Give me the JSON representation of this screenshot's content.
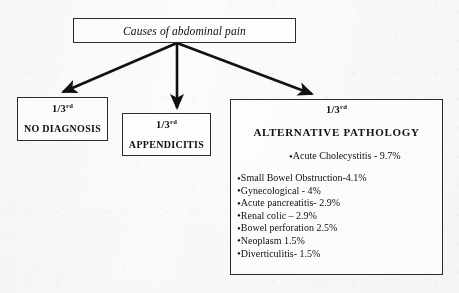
{
  "diagram": {
    "root": {
      "label": "Causes of abdominal pain"
    },
    "branches": [
      {
        "fraction": "1/3",
        "fraction_suffix": "rd",
        "title": "NO DIAGNOSIS"
      },
      {
        "fraction": "1/3",
        "fraction_suffix": "rd",
        "title": "APPENDICITIS"
      },
      {
        "fraction": "1/3",
        "fraction_suffix": "rd",
        "title": "ALTERNATIVE PATHOLOGY",
        "lead_item": "Acute Cholecystitis - 9.7%",
        "items": [
          "Small Bowel Obstruction-4.1%",
          "Gynecological - 4%",
          "Acute pancreatitis- 2.9%",
          "Renal colic – 2.9%",
          "Bowel perforation 2.5%",
          "Neoplasm 1.5%",
          "Diverticulitis- 1.5%"
        ]
      }
    ],
    "bullet_glyph": "•",
    "colors": {
      "ink": "#101010",
      "border": "#2b2b2b",
      "background": "#fbfbfb"
    }
  }
}
